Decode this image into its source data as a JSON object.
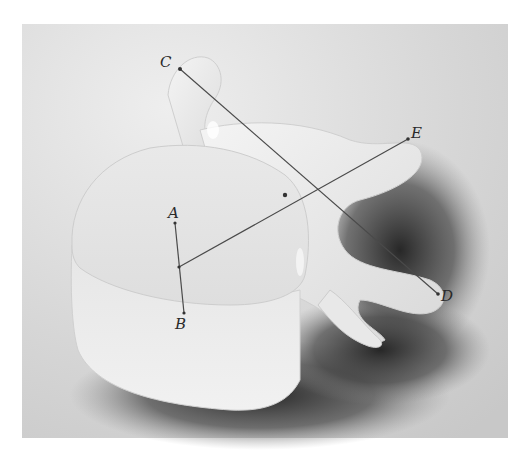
{
  "figure": {
    "colors": {
      "background": "#ffffff",
      "photo_bg": "#d8d8d8",
      "bone": "#ebebeb",
      "shadow": "#3a3a3a",
      "line": "#4a4a4a",
      "label": "#2a2a2a"
    },
    "points": [
      {
        "id": "A",
        "label": "A",
        "x": 175,
        "y": 223,
        "lx": 168,
        "ly": 218
      },
      {
        "id": "B",
        "label": "B",
        "x": 184,
        "y": 313,
        "lx": 175,
        "ly": 329
      },
      {
        "id": "C",
        "label": "C",
        "x": 180,
        "y": 69,
        "lx": 160,
        "ly": 67
      },
      {
        "id": "D",
        "label": "D",
        "x": 438,
        "y": 294,
        "lx": 441,
        "ly": 301
      },
      {
        "id": "E",
        "label": "E",
        "x": 408,
        "y": 139,
        "lx": 411,
        "ly": 138
      }
    ],
    "segments": [
      {
        "name": "segment-AB",
        "from": "A",
        "to": "B"
      },
      {
        "name": "segment-CD",
        "from": "C",
        "to": "D"
      },
      {
        "name": "segment-E-to-AB",
        "x1": 179,
        "y1": 267,
        "x2": 408,
        "y2": 139
      }
    ],
    "intersection": {
      "x": 285,
      "y": 195
    }
  }
}
